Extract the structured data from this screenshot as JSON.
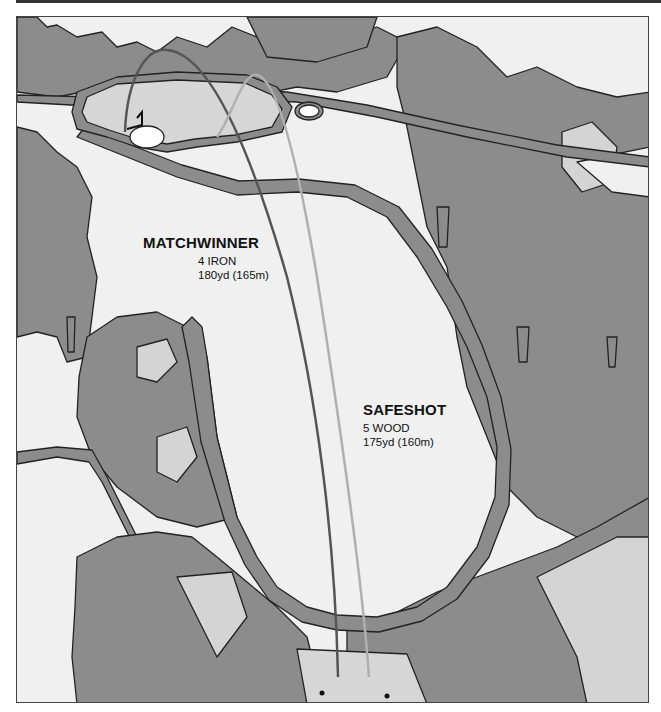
{
  "page": {
    "header_text": "THE MATCHWINNER'S GOLF BOOK (cropped)"
  },
  "colors": {
    "trees": "#8c8c8c",
    "rough_light": "#d4d4d4",
    "fairway": "#f0f0f0",
    "green": "#d6d6d6",
    "bunker": "#ffffff",
    "outline": "#222222",
    "matchwinner_path": "#555555",
    "safeshot_path": "#b0b0b0"
  },
  "shots": {
    "matchwinner": {
      "name": "MATCHWINNER",
      "club": "4 IRON",
      "distance": "180yd (165m)"
    },
    "safeshot": {
      "name": "SAFESHOT",
      "club": "5 WOOD",
      "distance": "175yd (160m)"
    }
  },
  "features": {
    "green": "putting green with flag",
    "bunkers": 2,
    "tee_markers": 2
  }
}
